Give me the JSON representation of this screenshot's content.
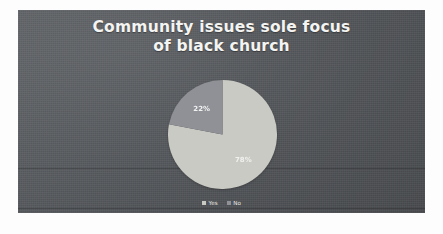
{
  "slide": {
    "title_line_1": "Community issues sole focus",
    "title_line_2": "of black church",
    "background_color": "#55585c",
    "title_color": "#f4f4f2"
  },
  "legend": {
    "items": [
      {
        "label": "Yes",
        "color": "#c9cac4"
      },
      {
        "label": "No",
        "color": "#8f9196"
      }
    ]
  },
  "chart_data": {
    "type": "pie",
    "title": "Community issues sole focus of black church",
    "categories": [
      "Yes",
      "No"
    ],
    "values": [
      78,
      22
    ],
    "value_labels": [
      "78%",
      "22%"
    ],
    "colors": [
      "#c9cac4",
      "#8f9196"
    ],
    "legend_position": "bottom",
    "start_angle": 0,
    "direction": "clockwise",
    "grid": false,
    "xlabel": "",
    "ylabel": ""
  }
}
